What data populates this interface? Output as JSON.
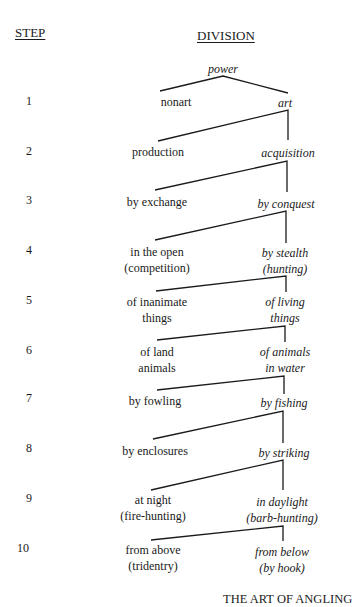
{
  "headers": {
    "step": "STEP",
    "division": "DIVISION"
  },
  "root": "power",
  "steps": [
    {
      "number": "1",
      "left": [
        "nonart"
      ],
      "right": [
        "art"
      ]
    },
    {
      "number": "2",
      "left": [
        "production"
      ],
      "right": [
        "acquisition"
      ]
    },
    {
      "number": "3",
      "left": [
        "by exchange"
      ],
      "right": [
        "by conquest"
      ]
    },
    {
      "number": "4",
      "left": [
        "in the open",
        "(competition)"
      ],
      "right": [
        "by stealth",
        "(hunting)"
      ]
    },
    {
      "number": "5",
      "left": [
        "of inanimate",
        "things"
      ],
      "right": [
        "of living",
        "things"
      ]
    },
    {
      "number": "6",
      "left": [
        "of land",
        "animals"
      ],
      "right": [
        "of animals",
        "in water"
      ]
    },
    {
      "number": "7",
      "left": [
        "by fowling"
      ],
      "right": [
        "by fishing"
      ]
    },
    {
      "number": "8",
      "left": [
        "by enclosures"
      ],
      "right": [
        "by striking"
      ]
    },
    {
      "number": "9",
      "left": [
        "at night",
        "(fire-hunting)"
      ],
      "right": [
        "in daylight",
        "(barb-hunting)"
      ]
    },
    {
      "number": "10",
      "left": [
        "from above",
        "(tridentry)"
      ],
      "right": [
        "from below",
        "(by hook)"
      ]
    }
  ],
  "caption": "THE ART OF ANGLING",
  "colors": {
    "ink": "#1a1a1a",
    "background": "#ffffff"
  }
}
